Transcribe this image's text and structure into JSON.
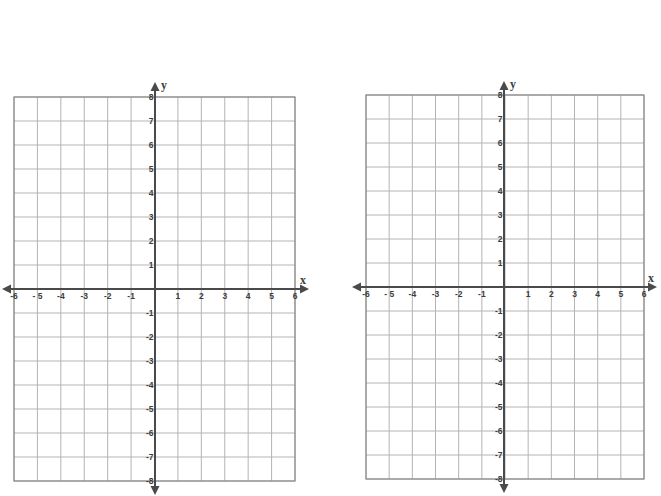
{
  "colors": {
    "grid": "#b4b4b4",
    "border": "#8a8a8a",
    "axis": "#4a4a4a",
    "label": "#3c3c3c",
    "background": "#ffffff"
  },
  "chart_data": [
    {
      "type": "scatter",
      "title": "",
      "xlabel": "x",
      "ylabel": "y",
      "xlim": [
        -6,
        6
      ],
      "ylim": [
        -8,
        8
      ],
      "grid": true,
      "x_ticks": [
        "-6",
        "- 5",
        "-4",
        "-3",
        "-2",
        "-1",
        "1",
        "2",
        "3",
        "4",
        "5",
        "6"
      ],
      "y_ticks": [
        "8",
        "7",
        "6",
        "5",
        "4",
        "3",
        "2",
        "1",
        "-1",
        "-2",
        "-3",
        "-4",
        "-5",
        "-6",
        "-7",
        "-8"
      ],
      "series": [],
      "layout": {
        "left": 14,
        "right": 295,
        "top": 97,
        "bottom": 481,
        "x_axis_y": 289,
        "y_axis_x": 155,
        "arrow_left": 2,
        "arrow_right": 309,
        "arrow_top": 82,
        "arrow_bottom": 495
      }
    },
    {
      "type": "scatter",
      "title": "",
      "xlabel": "x",
      "ylabel": "y",
      "xlim": [
        -6,
        6
      ],
      "ylim": [
        -8,
        8
      ],
      "grid": true,
      "x_ticks": [
        "-6",
        "- 5",
        "-4",
        "-3",
        "-2",
        "-1",
        "1",
        "2",
        "3",
        "4",
        "5",
        "6"
      ],
      "y_ticks": [
        "8",
        "7",
        "6",
        "5",
        "4",
        "3",
        "2",
        "1",
        "-1",
        "-2",
        "-3",
        "-4",
        "-5",
        "-6",
        "-7",
        "-8"
      ],
      "series": [],
      "layout": {
        "left": 366,
        "right": 644,
        "top": 95,
        "bottom": 479,
        "x_axis_y": 287,
        "y_axis_x": 504,
        "arrow_left": 352,
        "arrow_right": 657,
        "arrow_top": 81,
        "arrow_bottom": 493
      }
    }
  ]
}
